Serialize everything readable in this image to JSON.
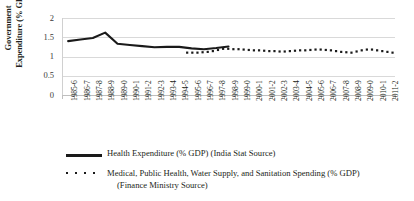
{
  "chart_data": {
    "type": "line",
    "title": "",
    "xlabel": "",
    "ylabel": "Government Expenditure (% GDP)",
    "ylabel_line1": "Government",
    "ylabel_line2": "Expenditure (% GDP)",
    "ylim": [
      0,
      2
    ],
    "yticks": [
      0,
      0.5,
      1,
      1.5,
      2
    ],
    "ytick_labels": [
      "0",
      "0.5",
      "1",
      "1.5",
      "2"
    ],
    "grid": true,
    "legend_position": "bottom",
    "categories": [
      "1985-6",
      "1986-7",
      "1987-8",
      "1988-9",
      "1989-0",
      "1990-1",
      "1991-2",
      "1992-3",
      "1993-4",
      "1994-5",
      "1995-6",
      "1996-7",
      "1997-8",
      "1998-9",
      "1999-0",
      "2000-1",
      "2001-2",
      "2002-3",
      "2003-4",
      "2004-5",
      "2005-6",
      "2006-7",
      "2007-8",
      "2008-9",
      "2009-0",
      "2010-1",
      "2011-2"
    ],
    "series": [
      {
        "name": "Health Expenditure (% GDP) (India Stat Source)",
        "style": "solid-line",
        "color": "#1a1a1a",
        "x": [
          "1985-6",
          "1986-7",
          "1987-8",
          "1988-9",
          "1989-0",
          "1990-1",
          "1991-2",
          "1992-3",
          "1993-4",
          "1994-5",
          "1995-6",
          "1996-7",
          "1997-8",
          "1998-9"
        ],
        "values": [
          1.4,
          1.44,
          1.48,
          1.62,
          1.33,
          1.3,
          1.27,
          1.24,
          1.25,
          1.25,
          1.21,
          1.19,
          1.22,
          1.26
        ]
      },
      {
        "name": "Medical, Public Health, Water Supply, and Sanitation Spending (% GDP) (Finance Ministry Source)",
        "style": "dotted-markers",
        "color": "#1a1a1a",
        "x": [
          "1995-6",
          "1996-7",
          "1997-8",
          "1998-9",
          "1999-0",
          "2000-1",
          "2001-2",
          "2002-3",
          "2003-4",
          "2004-5",
          "2005-6",
          "2006-7",
          "2007-8",
          "2008-9",
          "2009-0",
          "2010-1",
          "2011-2"
        ],
        "values": [
          1.1,
          1.1,
          1.11,
          1.13,
          1.2,
          1.2,
          1.18,
          1.16,
          1.14,
          1.13,
          1.15,
          1.16,
          1.18,
          1.16,
          1.12,
          1.09,
          1.11
        ],
        "dense_points": [
          1.1,
          1.1,
          1.1,
          1.11,
          1.12,
          1.14,
          1.17,
          1.2,
          1.2,
          1.19,
          1.19,
          1.18,
          1.17,
          1.16,
          1.16,
          1.15,
          1.14,
          1.14,
          1.13,
          1.13,
          1.14,
          1.15,
          1.16,
          1.16,
          1.17,
          1.18,
          1.18,
          1.17,
          1.16,
          1.14,
          1.12,
          1.11,
          1.1,
          1.13,
          1.16,
          1.18,
          1.18,
          1.16,
          1.14,
          1.12,
          1.1
        ]
      }
    ]
  },
  "legend": {
    "entry1_label": "Health Expenditure (% GDP) (India Stat Source)",
    "entry2_label_line1": "Medical, Public Health, Water Supply, and Sanitation Spending (% GDP)",
    "entry2_label_line2": "(Finance Ministry Source)"
  },
  "colors": {
    "series": "#1a1a1a",
    "gridline": "#d9d9d9",
    "axis": "#bfbfbf",
    "text": "#231f20",
    "background": "#ffffff"
  }
}
